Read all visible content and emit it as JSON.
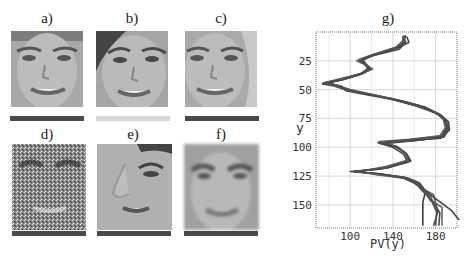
{
  "figure": {
    "panels": [
      {
        "id": "a",
        "label": "a)",
        "description": "face, frontal, original"
      },
      {
        "id": "b",
        "label": "b)",
        "description": "face, rotated/shifted"
      },
      {
        "id": "c",
        "label": "c)",
        "description": "face, shifted"
      },
      {
        "id": "d",
        "label": "d)",
        "description": "face with heavy noise"
      },
      {
        "id": "e",
        "label": "e)",
        "description": "face, zoomed/cropped side"
      },
      {
        "id": "f",
        "label": "f)",
        "description": "face, blurred"
      }
    ],
    "chart_label": "g)"
  },
  "chart_data": {
    "type": "line",
    "title": "g)",
    "xlabel": "PV(y)",
    "ylabel": "y",
    "xlim": [
      68,
      200
    ],
    "ylim": [
      170,
      0
    ],
    "x_ticks": [
      100,
      140,
      180
    ],
    "y_ticks": [
      25,
      50,
      75,
      100,
      125,
      150
    ],
    "grid": true,
    "orientation": "y-axis inverted, curves plotted vertically",
    "series": [
      {
        "name": "a",
        "points": [
          [
            152,
            3
          ],
          [
            150,
            8
          ],
          [
            148,
            12
          ],
          [
            120,
            20
          ],
          [
            108,
            24
          ],
          [
            112,
            27
          ],
          [
            118,
            31
          ],
          [
            110,
            36
          ],
          [
            92,
            41
          ],
          [
            75,
            44
          ],
          [
            88,
            47
          ],
          [
            95,
            50
          ],
          [
            118,
            54
          ],
          [
            140,
            58
          ],
          [
            160,
            63
          ],
          [
            180,
            70
          ],
          [
            188,
            76
          ],
          [
            190,
            82
          ],
          [
            186,
            90
          ],
          [
            160,
            93
          ],
          [
            128,
            96
          ],
          [
            142,
            99
          ],
          [
            152,
            105
          ],
          [
            155,
            112
          ],
          [
            130,
            118
          ],
          [
            105,
            121
          ],
          [
            125,
            123
          ],
          [
            150,
            126
          ],
          [
            162,
            130
          ],
          [
            165,
            135
          ],
          [
            170,
            140
          ],
          [
            168,
            148
          ],
          [
            168,
            155
          ],
          [
            168,
            168
          ]
        ]
      },
      {
        "name": "b",
        "points": [
          [
            150,
            3
          ],
          [
            152,
            9
          ],
          [
            145,
            14
          ],
          [
            125,
            19
          ],
          [
            112,
            24
          ],
          [
            115,
            28
          ],
          [
            120,
            32
          ],
          [
            112,
            36
          ],
          [
            95,
            41
          ],
          [
            80,
            44
          ],
          [
            90,
            47
          ],
          [
            100,
            50
          ],
          [
            120,
            54
          ],
          [
            145,
            59
          ],
          [
            165,
            64
          ],
          [
            183,
            71
          ],
          [
            190,
            77
          ],
          [
            192,
            84
          ],
          [
            188,
            91
          ],
          [
            162,
            94
          ],
          [
            130,
            97
          ],
          [
            145,
            100
          ],
          [
            153,
            106
          ],
          [
            157,
            112
          ],
          [
            135,
            118
          ],
          [
            103,
            121
          ],
          [
            128,
            123
          ],
          [
            155,
            127
          ],
          [
            165,
            131
          ],
          [
            170,
            137
          ],
          [
            178,
            141
          ],
          [
            180,
            148
          ],
          [
            182,
            156
          ],
          [
            178,
            168
          ]
        ]
      },
      {
        "name": "c",
        "points": [
          [
            153,
            4
          ],
          [
            155,
            9
          ],
          [
            140,
            15
          ],
          [
            122,
            20
          ],
          [
            110,
            25
          ],
          [
            116,
            29
          ],
          [
            119,
            32
          ],
          [
            108,
            37
          ],
          [
            90,
            42
          ],
          [
            74,
            45
          ],
          [
            86,
            47
          ],
          [
            98,
            51
          ],
          [
            122,
            55
          ],
          [
            150,
            60
          ],
          [
            170,
            65
          ],
          [
            185,
            72
          ],
          [
            192,
            78
          ],
          [
            193,
            85
          ],
          [
            185,
            92
          ],
          [
            158,
            94
          ],
          [
            126,
            96
          ],
          [
            140,
            100
          ],
          [
            150,
            106
          ],
          [
            154,
            113
          ],
          [
            128,
            119
          ],
          [
            100,
            121
          ],
          [
            122,
            123
          ],
          [
            148,
            126
          ],
          [
            160,
            131
          ],
          [
            167,
            136
          ],
          [
            176,
            142
          ],
          [
            185,
            148
          ],
          [
            195,
            155
          ],
          [
            202,
            163
          ]
        ]
      },
      {
        "name": "d",
        "points": [
          [
            151,
            3
          ],
          [
            149,
            8
          ],
          [
            143,
            13
          ],
          [
            118,
            21
          ],
          [
            106,
            25
          ],
          [
            113,
            28
          ],
          [
            121,
            32
          ],
          [
            111,
            36
          ],
          [
            93,
            40
          ],
          [
            76,
            44
          ],
          [
            89,
            48
          ],
          [
            97,
            50
          ],
          [
            116,
            54
          ],
          [
            138,
            58
          ],
          [
            158,
            63
          ],
          [
            178,
            69
          ],
          [
            187,
            75
          ],
          [
            189,
            83
          ],
          [
            184,
            90
          ],
          [
            156,
            93
          ],
          [
            127,
            95
          ],
          [
            141,
            99
          ],
          [
            151,
            104
          ],
          [
            154,
            111
          ],
          [
            132,
            117
          ],
          [
            108,
            121
          ],
          [
            126,
            124
          ],
          [
            152,
            127
          ],
          [
            163,
            130
          ],
          [
            166,
            135
          ],
          [
            172,
            140
          ],
          [
            175,
            146
          ],
          [
            186,
            152
          ],
          [
            186,
            168
          ]
        ]
      },
      {
        "name": "e",
        "points": [
          [
            149,
            4
          ],
          [
            151,
            10
          ],
          [
            146,
            15
          ],
          [
            123,
            20
          ],
          [
            111,
            24
          ],
          [
            114,
            28
          ],
          [
            117,
            33
          ],
          [
            109,
            37
          ],
          [
            94,
            41
          ],
          [
            78,
            44
          ],
          [
            92,
            47
          ],
          [
            96,
            51
          ],
          [
            119,
            55
          ],
          [
            143,
            59
          ],
          [
            162,
            64
          ],
          [
            182,
            71
          ],
          [
            189,
            77
          ],
          [
            191,
            84
          ],
          [
            187,
            91
          ],
          [
            161,
            94
          ],
          [
            129,
            97
          ],
          [
            144,
            100
          ],
          [
            153,
            106
          ],
          [
            156,
            112
          ],
          [
            134,
            118
          ],
          [
            104,
            121
          ],
          [
            127,
            123
          ],
          [
            153,
            127
          ],
          [
            164,
            131
          ],
          [
            168,
            136
          ],
          [
            174,
            141
          ],
          [
            178,
            148
          ],
          [
            184,
            157
          ],
          [
            183,
            168
          ]
        ]
      },
      {
        "name": "f",
        "points": [
          [
            150,
            3
          ],
          [
            150,
            9
          ],
          [
            142,
            14
          ],
          [
            121,
            20
          ],
          [
            109,
            25
          ],
          [
            114,
            28
          ],
          [
            119,
            32
          ],
          [
            110,
            36
          ],
          [
            92,
            41
          ],
          [
            77,
            44
          ],
          [
            89,
            47
          ],
          [
            97,
            50
          ],
          [
            117,
            54
          ],
          [
            141,
            59
          ],
          [
            161,
            64
          ],
          [
            181,
            70
          ],
          [
            189,
            76
          ],
          [
            191,
            83
          ],
          [
            186,
            91
          ],
          [
            159,
            93
          ],
          [
            128,
            96
          ],
          [
            143,
            99
          ],
          [
            152,
            105
          ],
          [
            155,
            112
          ],
          [
            131,
            118
          ],
          [
            106,
            121
          ],
          [
            124,
            123
          ],
          [
            151,
            126
          ],
          [
            162,
            130
          ],
          [
            166,
            135
          ],
          [
            171,
            141
          ],
          [
            177,
            148
          ],
          [
            181,
            156
          ],
          [
            180,
            168
          ]
        ]
      }
    ]
  }
}
